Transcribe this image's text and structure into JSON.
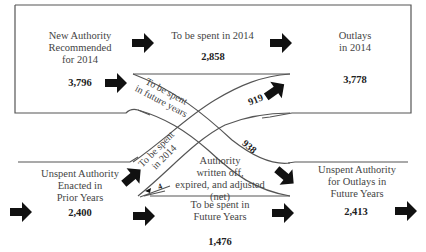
{
  "diagram": {
    "top_section": {
      "new_authority": {
        "label_lines": [
          "New Authority",
          "Recommended",
          "for 2014"
        ],
        "value": "3,796"
      },
      "spent_2014": {
        "label": "To be spent in 2014",
        "value": "2,858"
      },
      "outlays_2014": {
        "label_lines": [
          "Outlays",
          "in 2014"
        ],
        "value": "3,778"
      }
    },
    "crossing_flows": {
      "future_years_band": {
        "label_lines": [
          "To be spent",
          "in future years"
        ],
        "value": "938"
      },
      "spent_2014_band": {
        "label_lines": [
          "To be spent",
          "in 2014"
        ],
        "value": "919"
      }
    },
    "bottom_section": {
      "unspent_prior": {
        "label_lines": [
          "Unspent Authority",
          "Enacted in",
          "Prior Years"
        ],
        "value": "2,400"
      },
      "written_off": {
        "label_lines": [
          "Authority",
          "written off,",
          "expired, and adjusted",
          "(net)"
        ],
        "value": "4"
      },
      "future_years": {
        "label_lines": [
          "To be spent in",
          "Future Years"
        ],
        "value": "1,476"
      },
      "unspent_future": {
        "label_lines": [
          "Unspent Authority",
          "for Outlays in",
          "Future Years"
        ],
        "value": "2,413"
      }
    },
    "colors": {
      "line": "#555555",
      "arrow": "#111111",
      "background": "#ffffff"
    }
  }
}
